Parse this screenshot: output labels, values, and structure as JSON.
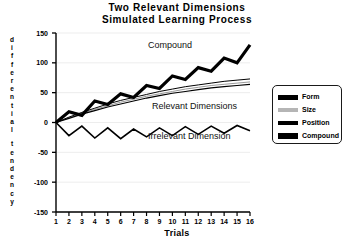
{
  "chart_data": {
    "type": "line",
    "title": "Two Relevant Dimensions",
    "subtitle": "Simulated Learning Process",
    "xlabel": "Trials",
    "ylabel": "differential tendency",
    "grid": true,
    "legend_position": "right",
    "xlim": [
      1,
      16
    ],
    "ylim": [
      -150,
      150
    ],
    "xticks": [
      1,
      2,
      3,
      4,
      5,
      6,
      7,
      8,
      9,
      10,
      11,
      12,
      13,
      14,
      15,
      16
    ],
    "yticks": [
      150,
      100,
      50,
      0,
      -50,
      -100,
      -150
    ],
    "x": [
      1,
      2,
      3,
      4,
      5,
      6,
      7,
      8,
      9,
      10,
      11,
      12,
      13,
      14,
      15,
      16
    ],
    "series": [
      {
        "name": "Compound",
        "color": "#000000",
        "linewidth": 3.2,
        "values": [
          0,
          18,
          12,
          36,
          30,
          48,
          42,
          62,
          57,
          78,
          72,
          92,
          86,
          108,
          100,
          130
        ]
      },
      {
        "name": "Form",
        "color": "#000000",
        "linewidth": 1.0,
        "values": [
          0,
          9,
          17,
          24,
          31,
          37,
          42,
          47,
          52,
          56,
          60,
          63,
          66,
          69,
          71,
          73
        ]
      },
      {
        "name": "Size",
        "color": "#9a9a9a",
        "linewidth": 1.0,
        "values": [
          0,
          8,
          15,
          22,
          28,
          34,
          39,
          44,
          48,
          52,
          56,
          59,
          62,
          64,
          66,
          68
        ]
      },
      {
        "name": "Position",
        "color": "#000000",
        "linewidth": 1.2,
        "values": [
          0,
          7,
          14,
          20,
          26,
          31,
          36,
          41,
          45,
          49,
          52,
          55,
          58,
          60,
          62,
          64
        ]
      },
      {
        "name": "Irrelevant Dimension",
        "color": "#000000",
        "linewidth": 1.6,
        "values": [
          0,
          -22,
          -6,
          -26,
          -9,
          -27,
          -11,
          -24,
          -9,
          -22,
          -7,
          -20,
          -6,
          -18,
          -5,
          -14
        ]
      }
    ],
    "annotations": [
      {
        "text": "Compound",
        "x_px": 148,
        "y_px": 40
      },
      {
        "text": "Relevant Dimensions",
        "x_px": 152,
        "y_px": 101
      },
      {
        "text": "Irrelevant Dimension",
        "x_px": 148,
        "y_px": 131
      }
    ]
  },
  "legend": {
    "items": [
      {
        "label": "Form",
        "color": "#000000",
        "thickness": 5
      },
      {
        "label": "Size",
        "color": "#b5b5b5",
        "thickness": 4
      },
      {
        "label": "Position",
        "color": "#000000",
        "thickness": 4
      },
      {
        "label": "Compound",
        "color": "#000000",
        "thickness": 6
      }
    ]
  },
  "ylabel_chars": [
    "d",
    "i",
    "f",
    "f",
    "e",
    "r",
    "e",
    "n",
    "t",
    "i",
    "a",
    "l",
    "",
    "t",
    "e",
    "n",
    "d",
    "e",
    "n",
    "c",
    "y"
  ]
}
